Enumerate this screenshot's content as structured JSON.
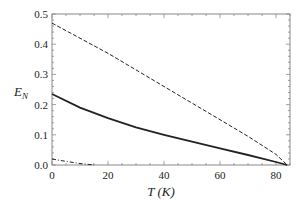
{
  "chart_data": {
    "type": "line",
    "title": "",
    "xlabel": "T (K)",
    "ylabel": "E_N",
    "xlim": [
      0,
      85
    ],
    "ylim": [
      0,
      0.5
    ],
    "xticks": [
      0,
      20,
      40,
      60,
      80
    ],
    "yticks": [
      0.0,
      0.1,
      0.2,
      0.3,
      0.4,
      0.5
    ],
    "xtick_labels": [
      "0",
      "20",
      "40",
      "60",
      "80"
    ],
    "ytick_labels": [
      "0.0",
      "0.1",
      "0.2",
      "0.3",
      "0.4",
      "0.5"
    ],
    "grid": false,
    "legend": null,
    "series": [
      {
        "name": "dashed",
        "style": "dashed",
        "x": [
          0,
          10,
          20,
          30,
          40,
          50,
          60,
          70,
          80,
          84
        ],
        "y": [
          0.47,
          0.42,
          0.37,
          0.315,
          0.26,
          0.205,
          0.15,
          0.095,
          0.035,
          0.0
        ]
      },
      {
        "name": "solid",
        "style": "solid",
        "x": [
          0,
          10,
          20,
          30,
          40,
          50,
          60,
          70,
          80,
          84
        ],
        "y": [
          0.235,
          0.19,
          0.155,
          0.125,
          0.1,
          0.077,
          0.055,
          0.033,
          0.01,
          0.0
        ]
      },
      {
        "name": "dot-dashed",
        "style": "dotdash",
        "x": [
          0,
          5,
          10,
          15
        ],
        "y": [
          0.02,
          0.012,
          0.005,
          0.0
        ]
      }
    ]
  },
  "axes": {
    "x_label_main": "T",
    "x_label_unit": "(K)",
    "y_label_main": "E",
    "y_label_sub": "N"
  }
}
